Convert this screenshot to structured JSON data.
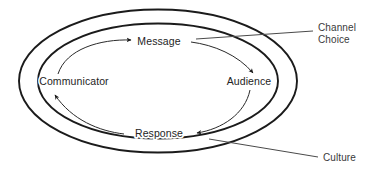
{
  "diagram": {
    "type": "cyclical-process-diagram",
    "background_color": "#ffffff",
    "stroke_color": "#1b1b1b",
    "text_color": "#242424",
    "nodes": [
      {
        "id": "communicator",
        "label": "Communicator",
        "x": 74,
        "y": 81
      },
      {
        "id": "audience",
        "label": "Audience",
        "x": 249,
        "y": 81
      },
      {
        "id": "message",
        "label": "Message",
        "x": 159,
        "y": 42
      },
      {
        "id": "response",
        "label": "Response",
        "x": 159,
        "y": 134
      }
    ],
    "flows": [
      {
        "id": "message-flow",
        "label": "Message",
        "from": "communicator",
        "to": "audience",
        "direction": "left-to-right",
        "arrowheads": 2
      },
      {
        "id": "response-flow",
        "label": "Response",
        "from": "audience",
        "to": "communicator",
        "direction": "right-to-left",
        "arrowheads": 2
      }
    ],
    "rings": [
      {
        "id": "outer-ring",
        "label": "Culture",
        "rx": 139,
        "ry": 72
      },
      {
        "id": "inner-ring",
        "label": "Channel Choice",
        "rx": 120,
        "ry": 58
      }
    ],
    "callouts": [
      {
        "id": "channel-choice-callout",
        "line1": "Channel",
        "line2": "Choice",
        "target_ring": "inner-ring",
        "position": "top-right"
      },
      {
        "id": "culture-callout",
        "line1": "Culture",
        "line2": "",
        "target_ring": "outer-ring",
        "position": "bottom-right"
      }
    ]
  }
}
